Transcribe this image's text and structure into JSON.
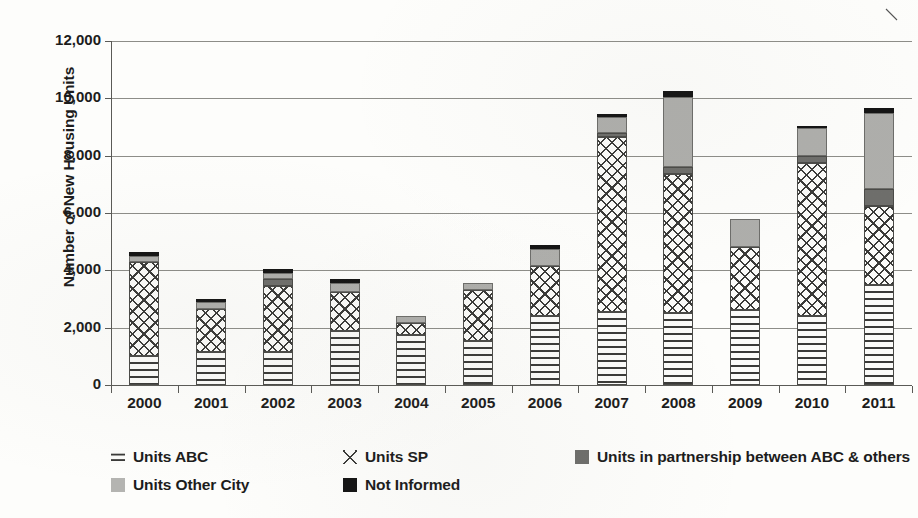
{
  "chart_data": {
    "type": "bar",
    "subtype": "stacked-bar",
    "title": "",
    "xlabel": "",
    "ylabel": "Number of New Housing Units",
    "ylim": [
      0,
      12000
    ],
    "ytick_labels": [
      "12,000",
      "10,000",
      "8,000",
      "6,000",
      "4,000",
      "2,000",
      "0"
    ],
    "ytick_values": [
      12000,
      10000,
      8000,
      6000,
      4000,
      2000,
      0
    ],
    "grid": true,
    "legend_position": "bottom-left",
    "categories": [
      "2000",
      "2001",
      "2002",
      "2003",
      "2004",
      "2005",
      "2006",
      "2007",
      "2008",
      "2009",
      "2010",
      "2011"
    ],
    "series": [
      {
        "name": "Units ABC",
        "pattern": "dotted",
        "values": [
          1000,
          1150,
          1150,
          1900,
          1750,
          1550,
          2400,
          2550,
          2500,
          2600,
          2400,
          3500
        ]
      },
      {
        "name": "Units SP",
        "pattern": "cross-hatch",
        "values": [
          3300,
          1500,
          2300,
          1350,
          400,
          1750,
          1750,
          6100,
          4850,
          2200,
          5350,
          2750
        ]
      },
      {
        "name": "Units in partnership between ABC & others",
        "color": "#6e6e6b",
        "values": [
          0,
          0,
          250,
          0,
          0,
          0,
          0,
          150,
          250,
          0,
          250,
          600
        ]
      },
      {
        "name": "Units Other City",
        "color": "#aeaeab",
        "values": [
          200,
          250,
          200,
          300,
          250,
          250,
          600,
          550,
          2450,
          1000,
          950,
          2650
        ]
      },
      {
        "name": "Not Informed",
        "color": "#141414",
        "values": [
          150,
          100,
          150,
          150,
          0,
          0,
          150,
          100,
          200,
          0,
          100,
          150
        ]
      }
    ],
    "totals": [
      4650,
      3000,
      4050,
      3700,
      2400,
      3550,
      4900,
      9450,
      10250,
      5800,
      9050,
      9650
    ]
  },
  "legend": {
    "items": [
      {
        "label": "Units ABC",
        "swatch": "s-abc"
      },
      {
        "label": "Units SP",
        "swatch": "s-sp"
      },
      {
        "label": "Units in partnership between ABC & others",
        "swatch": "s-partner"
      },
      {
        "label": "Units Other City",
        "swatch": "s-other"
      },
      {
        "label": "Not Informed",
        "swatch": "s-notinf"
      }
    ]
  }
}
